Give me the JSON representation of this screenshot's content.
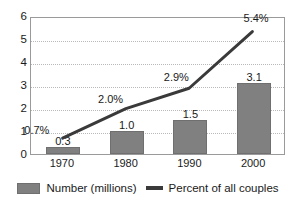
{
  "chart_data": {
    "type": "bar",
    "title": "",
    "subtitle": "",
    "xlabel": "",
    "ylabel": "",
    "categories": [
      "1970",
      "1980",
      "1990",
      "2000"
    ],
    "ylim": [
      0,
      6
    ],
    "yticks": [
      "0",
      "1",
      "2",
      "3",
      "4",
      "5",
      "6"
    ],
    "grid": true,
    "legend_position": "bottom",
    "series": [
      {
        "name": "Number  (millions)",
        "type": "bar",
        "color": "#808080",
        "values": [
          0.3,
          1.0,
          1.5,
          3.1
        ],
        "labels": [
          "0.3",
          "1.0",
          "1.5",
          "3.1"
        ]
      },
      {
        "name": "Percent of all couples",
        "type": "line",
        "color": "#3a3a3a",
        "values": [
          0.7,
          2.0,
          2.9,
          5.4
        ],
        "labels": [
          "0.7%",
          "2.0%",
          "2.9%",
          "5.4%"
        ]
      }
    ]
  },
  "legend": {
    "entries": [
      {
        "label": "Number  (millions)",
        "marker": "bar-swatch"
      },
      {
        "label": "Percent of all couples",
        "marker": "line-swatch"
      }
    ]
  },
  "colors": {
    "bar": "#808080",
    "bar_border": "#6f6f6f",
    "line": "#3a3a3a",
    "grid": "#b9b9b9",
    "frame": "#9a9a9a",
    "text": "#1a1a1a",
    "background": "#ffffff"
  }
}
